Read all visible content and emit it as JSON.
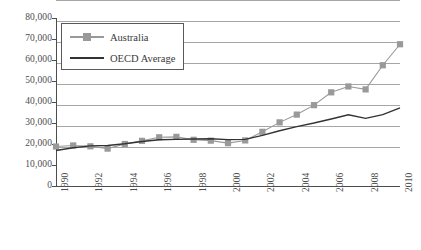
{
  "chart_data": {
    "type": "line",
    "title": "",
    "xlabel": "",
    "ylabel": "",
    "x": [
      1990,
      1991,
      1992,
      1993,
      1994,
      1995,
      1996,
      1997,
      1998,
      1999,
      2000,
      2001,
      2002,
      2003,
      2004,
      2005,
      2006,
      2007,
      2008,
      2009,
      2010
    ],
    "xlim": [
      1990,
      2010
    ],
    "ylim": [
      0,
      80000
    ],
    "ytick_labels": [
      "80,000",
      "70,000",
      "60,000",
      "50,000",
      "40,000",
      "30,000",
      "20,000",
      "10,000",
      "0"
    ],
    "ytick_values": [
      80000,
      70000,
      60000,
      50000,
      40000,
      30000,
      20000,
      10000,
      0
    ],
    "xtick_labels": [
      "1990",
      "1992",
      "1994",
      "1996",
      "1998",
      "2000",
      "2002",
      "2004",
      "2006",
      "2008",
      "2010"
    ],
    "xtick_values": [
      1990,
      1992,
      1994,
      1996,
      1998,
      2000,
      2002,
      2004,
      2006,
      2008,
      2010
    ],
    "grid": true,
    "legend_position": "top-left",
    "series": [
      {
        "name": "Australia",
        "color": "#999999",
        "marker": "square",
        "values": [
          18800,
          19300,
          18900,
          17800,
          20000,
          21500,
          23200,
          23400,
          22000,
          21600,
          20400,
          21700,
          25800,
          30300,
          34000,
          38500,
          44600,
          47400,
          46000,
          57500,
          67500
        ]
      },
      {
        "name": "OECD Average",
        "color": "#333333",
        "marker": "none",
        "values": [
          16900,
          18200,
          19100,
          19300,
          20100,
          21200,
          22000,
          22200,
          22400,
          22500,
          22100,
          22200,
          24100,
          26300,
          28300,
          30000,
          31900,
          33900,
          32200,
          34000,
          37200
        ]
      }
    ]
  },
  "legend": {
    "items": [
      {
        "label": "Australia",
        "color": "#999999",
        "type": "line-marker"
      },
      {
        "label": "OECD Average",
        "color": "#333333",
        "type": "line"
      }
    ]
  },
  "colors": {
    "australia": "#999999",
    "oecd": "#333333",
    "gridline": "#a6a6a6",
    "axis": "#4d4d4d",
    "background": "#ffffff"
  }
}
